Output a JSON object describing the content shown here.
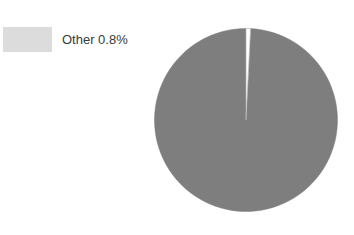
{
  "figure": {
    "width": 354,
    "height": 235,
    "background": "#ffffff"
  },
  "legend": {
    "position": "top-left",
    "items": [
      {
        "label": "Other 0.8%",
        "name": "Other",
        "value": 0.8,
        "color": "#dcdcdc"
      }
    ]
  },
  "pie": {
    "center_x": 246,
    "center_y": 120,
    "diameter": 184,
    "start_angle_deg": 0,
    "main_color": "#7e7e7e",
    "other_color": "#ffffff",
    "edge_color": "#f7f7f7"
  },
  "chart_data": {
    "type": "pie",
    "title": "",
    "subtitle": "",
    "xlabel": "",
    "ylabel": "",
    "grid": false,
    "legend_position": "top-left",
    "labels": [
      "Main",
      "Other"
    ],
    "values": [
      99.2,
      0.8
    ],
    "colors": [
      "#7e7e7e",
      "#dcdcdc"
    ],
    "annotations": [
      "Other 0.8%"
    ]
  }
}
